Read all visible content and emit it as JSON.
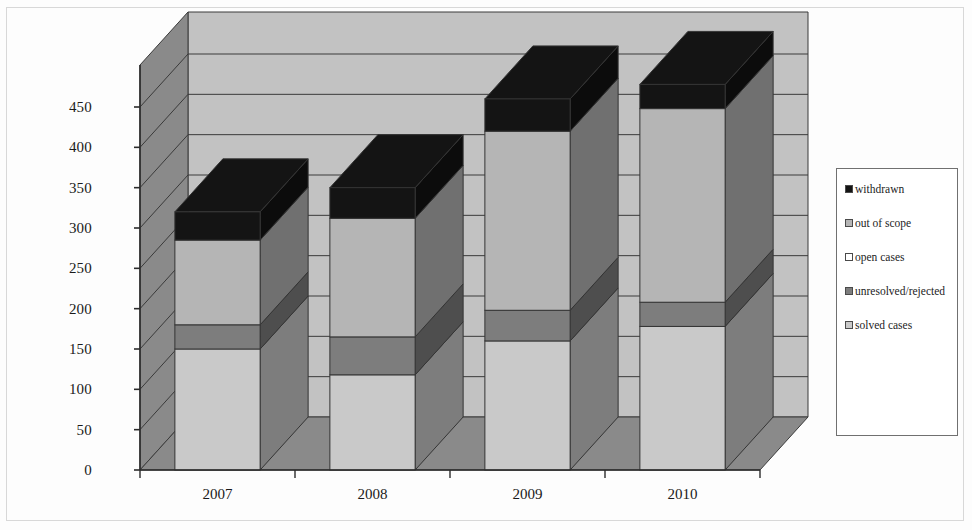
{
  "chart_data": {
    "type": "bar",
    "subtype": "stacked-column-3d",
    "title": "",
    "xlabel": "",
    "ylabel": "",
    "categories": [
      "2007",
      "2008",
      "2009",
      "2010"
    ],
    "ylim": [
      0,
      450
    ],
    "ytick_step": 50,
    "yticks": [
      0,
      50,
      100,
      150,
      200,
      250,
      300,
      350,
      400,
      450
    ],
    "ytick_labels": [
      "0",
      "50",
      "100",
      "150",
      "200",
      "250",
      "300",
      "350",
      "400",
      "450"
    ],
    "grid": true,
    "grid_axis": "y",
    "legend_position": "right",
    "stack_order_bottom_to_top": [
      "solved cases",
      "unresolved/rejected",
      "open cases",
      "out of scope",
      "withdrawn"
    ],
    "series": [
      {
        "name": "solved cases",
        "color": "#c9c9c9",
        "values": [
          150,
          118,
          160,
          178
        ]
      },
      {
        "name": "unresolved/rejected",
        "color": "#7d7d7d",
        "values": [
          30,
          47,
          38,
          30
        ]
      },
      {
        "name": "open cases",
        "color": "#ffffff",
        "values": [
          0,
          0,
          0,
          0
        ]
      },
      {
        "name": "out of scope",
        "color": "#b5b5b5",
        "values": [
          105,
          147,
          222,
          240
        ]
      },
      {
        "name": "withdrawn",
        "color": "#141414",
        "values": [
          35,
          38,
          40,
          30
        ]
      }
    ],
    "totals": [
      320,
      350,
      460,
      478
    ],
    "annotations": []
  },
  "legend": {
    "items": [
      {
        "label": "withdrawn",
        "color": "#141414"
      },
      {
        "label": "out of scope",
        "color": "#b5b5b5"
      },
      {
        "label": "open cases",
        "color": "#ffffff"
      },
      {
        "label": "unresolved/rejected",
        "color": "#7d7d7d"
      },
      {
        "label": "solved cases",
        "color": "#c9c9c9"
      }
    ]
  },
  "palette": {
    "back_wall": "#c2c2c2",
    "side_wall": "#8a8a8a",
    "floor": "#8a8a8a",
    "gridline": "#3a3a3a",
    "axis_line": "#2b2b2b",
    "bar_front_light": "#c9c9c9",
    "bar_side_dark": "#7a7a7a",
    "text": "#1a1a1a",
    "frame": "#a8a8a8",
    "background": "#fdfdfd"
  }
}
